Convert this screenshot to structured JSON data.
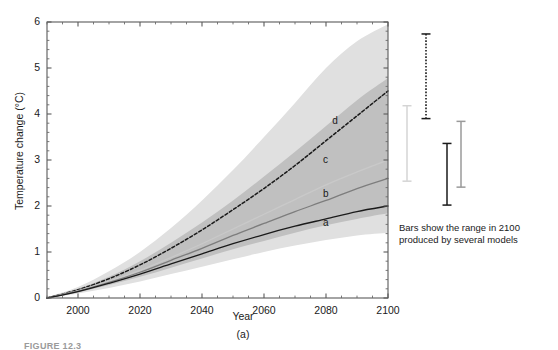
{
  "figure": {
    "panel_letter": "(a)",
    "caption_bottom": "FIGURE 12.3",
    "bars_caption_line1": "Bars show the range in 2100",
    "bars_caption_line2": "produced by several models"
  },
  "chart_data": {
    "type": "line",
    "title": "",
    "xlabel": "Year",
    "ylabel": "Temperature change (°C)",
    "xlim": [
      1990,
      2100
    ],
    "ylim": [
      0,
      6
    ],
    "xticks": [
      2000,
      2020,
      2040,
      2060,
      2080,
      2100
    ],
    "yticks": [
      0,
      1,
      2,
      3,
      4,
      5,
      6
    ],
    "xtick_labels": [
      "2000",
      "2020",
      "2040",
      "2060",
      "2080",
      "2100"
    ],
    "ytick_labels": [
      "0",
      "1",
      "2",
      "3",
      "4",
      "5",
      "6"
    ],
    "grid": false,
    "legend": "inline-curve-labels",
    "minor_ticks": true,
    "x": [
      1990,
      2000,
      2010,
      2020,
      2030,
      2040,
      2050,
      2060,
      2070,
      2080,
      2090,
      2100
    ],
    "series": [
      {
        "name": "d",
        "label": "d",
        "style": "dashed",
        "color": "#1a1a1a",
        "label_x": 2082,
        "label_y": 3.85,
        "values": [
          0.0,
          0.18,
          0.42,
          0.72,
          1.08,
          1.48,
          1.92,
          2.38,
          2.88,
          3.42,
          3.96,
          4.5
        ]
      },
      {
        "name": "c",
        "label": "c",
        "style": "solid",
        "color": "#c9c9c9",
        "label_x": 2079,
        "label_y": 3.0,
        "values": [
          0.0,
          0.16,
          0.36,
          0.6,
          0.88,
          1.18,
          1.5,
          1.82,
          2.14,
          2.46,
          2.74,
          3.0
        ]
      },
      {
        "name": "b",
        "label": "b",
        "style": "solid",
        "color": "#7d7d7d",
        "label_x": 2079,
        "label_y": 2.26,
        "values": [
          0.0,
          0.15,
          0.34,
          0.56,
          0.82,
          1.08,
          1.36,
          1.62,
          1.88,
          2.12,
          2.38,
          2.6
        ]
      },
      {
        "name": "a",
        "label": "a",
        "style": "solid",
        "color": "#1a1a1a",
        "label_x": 2079,
        "label_y": 1.62,
        "values": [
          0.0,
          0.14,
          0.32,
          0.52,
          0.74,
          0.96,
          1.18,
          1.38,
          1.56,
          1.72,
          1.88,
          2.0
        ]
      }
    ],
    "bands": [
      {
        "name": "outer-envelope",
        "color": "#e0e0e0",
        "upper": [
          0.02,
          0.24,
          0.58,
          1.0,
          1.52,
          2.12,
          2.78,
          3.5,
          4.24,
          5.0,
          5.58,
          5.95
        ],
        "lower": [
          0.0,
          0.1,
          0.22,
          0.36,
          0.52,
          0.68,
          0.84,
          1.0,
          1.14,
          1.26,
          1.36,
          1.42
        ]
      },
      {
        "name": "inner-envelope",
        "color": "#c0c0c0",
        "upper": [
          0.01,
          0.2,
          0.46,
          0.8,
          1.2,
          1.64,
          2.12,
          2.64,
          3.18,
          3.74,
          4.3,
          4.78
        ],
        "lower": [
          0.0,
          0.12,
          0.28,
          0.46,
          0.66,
          0.86,
          1.06,
          1.24,
          1.42,
          1.58,
          1.72,
          1.84
        ]
      }
    ],
    "range_bars": [
      {
        "name": "bar-1",
        "style": "solid",
        "color": "#d4d4d4",
        "x_px": 407,
        "top": 4.18,
        "bottom": 2.54
      },
      {
        "name": "bar-2",
        "style": "dotted",
        "color": "#1a1a1a",
        "x_px": 426,
        "top": 5.74,
        "bottom": 3.9
      },
      {
        "name": "bar-3",
        "style": "solid",
        "color": "#1a1a1a",
        "x_px": 447,
        "top": 3.36,
        "bottom": 2.02
      },
      {
        "name": "bar-4",
        "style": "solid",
        "color": "#9a9a9a",
        "x_px": 461,
        "top": 3.84,
        "bottom": 2.41
      }
    ]
  }
}
